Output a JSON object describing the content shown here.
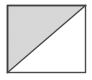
{
  "figure": {
    "name": "half-shaded-square",
    "title": "Square divided by a diagonal with the upper-left half shaded",
    "canvas": {
      "width": 92,
      "height": 80,
      "background_color": "#ffffff"
    },
    "square": {
      "label": "square outline",
      "left": 7.5,
      "top": 5.5,
      "right": 85.5,
      "bottom": 72.5,
      "width": 78,
      "height": 67,
      "stroke_color": "#4a4a4a",
      "stroke_width": 1.4,
      "fill_color": "#ffffff"
    },
    "diagonal": {
      "label": "diagonal line",
      "from_corner": "top-right",
      "to_corner": "bottom-left",
      "x1": 85.5,
      "y1": 5.5,
      "x2": 7.5,
      "y2": 72.5,
      "stroke_color": "#4a4a4a",
      "stroke_width": 1.4
    },
    "regions": [
      {
        "name": "upper-left-triangle",
        "label": "shaded half",
        "shading": "light gray",
        "fill_color": "#d8d8d8",
        "vertices": "7.5,5.5 85.5,5.5 7.5,72.5"
      },
      {
        "name": "lower-right-triangle",
        "label": "unshaded half",
        "shading": "white",
        "fill_color": "#ffffff",
        "vertices": "85.5,5.5 85.5,72.5 7.5,72.5"
      }
    ]
  }
}
